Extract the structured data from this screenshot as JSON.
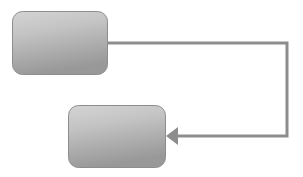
{
  "canvas": {
    "width": 303,
    "height": 177,
    "background": "#ffffff"
  },
  "diagram": {
    "type": "flowchart",
    "title": "",
    "nodes": [
      {
        "id": "node-1",
        "shape": "rounded-rectangle",
        "label": "",
        "x": 12,
        "y": 11,
        "width": 96,
        "height": 64,
        "corner_radius": 10,
        "fill_top": "#cfcfcf",
        "fill_bottom": "#9b9b9b",
        "border_color": "#8d8d8d",
        "border_width": 1
      },
      {
        "id": "node-2",
        "shape": "rounded-rectangle",
        "label": "",
        "x": 68,
        "y": 105,
        "width": 98,
        "height": 63,
        "corner_radius": 10,
        "fill_top": "#cfcfcf",
        "fill_bottom": "#9b9b9b",
        "border_color": "#8d8d8d",
        "border_width": 1
      }
    ],
    "edges": [
      {
        "id": "edge-1",
        "from": "node-1",
        "to": "node-2",
        "label": "",
        "style": "orthogonal",
        "line_color": "#8d8d8d",
        "line_width": 3,
        "arrowhead": "solid-triangle",
        "arrowhead_at": "to",
        "arrowhead_direction": "left",
        "points": "108,43 287,43 287,136 175,136",
        "arrow_tip_x": 166,
        "arrow_tip_y": 136,
        "arrow_length": 12,
        "arrow_half_width": 9
      }
    ]
  }
}
